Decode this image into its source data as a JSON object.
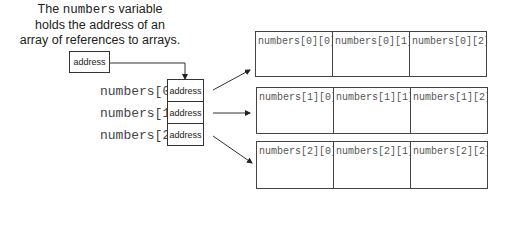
{
  "caption": {
    "line1_pre": "The ",
    "line1_code": "numbers",
    "line1_post": " variable",
    "line2": "holds the address of an",
    "line3": "array of references to arrays."
  },
  "variable_box": {
    "label": "address"
  },
  "reference_array": {
    "labels": [
      "numbers[0]",
      "numbers[1]",
      "numbers[2]"
    ],
    "cells": [
      "address",
      "address",
      "address"
    ]
  },
  "rows": [
    [
      "numbers[0][0]",
      "numbers[0][1]",
      "numbers[0][2]"
    ],
    [
      "numbers[1][0]",
      "numbers[1][1]",
      "numbers[1][2]"
    ],
    [
      "numbers[2][0]",
      "numbers[2][1]",
      "numbers[2][2]"
    ]
  ]
}
